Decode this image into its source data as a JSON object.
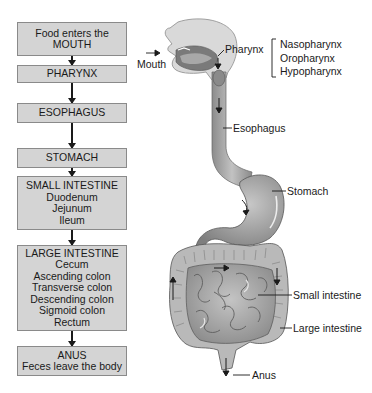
{
  "flowchart": {
    "boxes": [
      {
        "id": "mouth",
        "lines": [
          "Food enters the",
          "MOUTH"
        ]
      },
      {
        "id": "pharynx",
        "lines": [
          "PHARYNX"
        ]
      },
      {
        "id": "esophagus",
        "lines": [
          "ESOPHAGUS"
        ]
      },
      {
        "id": "stomach",
        "lines": [
          "STOMACH"
        ]
      },
      {
        "id": "small-intestine",
        "lines": [
          "SMALL INTESTINE",
          "Duodenum",
          "Jejunum",
          "Ileum"
        ]
      },
      {
        "id": "large-intestine",
        "lines": [
          "LARGE INTESTINE",
          "Cecum",
          "Ascending colon",
          "Transverse colon",
          "Descending colon",
          "Sigmoid colon",
          "Rectum"
        ]
      },
      {
        "id": "anus",
        "lines": [
          "ANUS",
          "Feces leave the body"
        ]
      }
    ]
  },
  "illustration": {
    "labels": {
      "mouth": "Mouth",
      "pharynx": "Pharynx",
      "pharynx_parts": [
        "Nasopharynx",
        "Oropharynx",
        "Hypopharynx"
      ],
      "esophagus": "Esophagus",
      "stomach": "Stomach",
      "small_intestine": "Small intestine",
      "large_intestine": "Large intestine",
      "anus": "Anus"
    }
  },
  "colors": {
    "box_fill": "#d4d4d4",
    "box_border": "#8a8a8a",
    "organ_fill": "#a8a8a8",
    "organ_dark": "#6e6e6e",
    "text": "#1a1a1a"
  }
}
